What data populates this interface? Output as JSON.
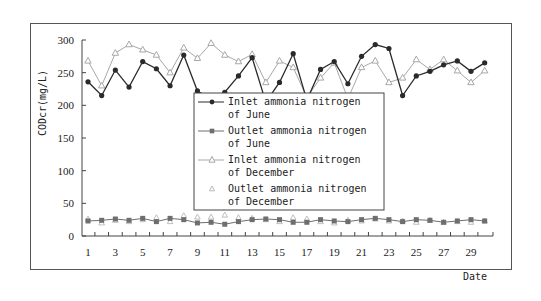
{
  "chart_data": {
    "type": "line",
    "title": "",
    "xlabel": "Date",
    "ylabel": "CODcr(mg/L)",
    "ylim": [
      0,
      300
    ],
    "xlim": [
      1,
      30
    ],
    "yticks": [
      0,
      50,
      100,
      150,
      200,
      250,
      300
    ],
    "xtick_labels": [
      "1",
      "3",
      "5",
      "7",
      "9",
      "11",
      "13",
      "15",
      "17",
      "19",
      "21",
      "23",
      "25",
      "27",
      "29"
    ],
    "xtick_values": [
      1,
      3,
      5,
      7,
      9,
      11,
      13,
      15,
      17,
      19,
      21,
      23,
      25,
      27,
      29
    ],
    "grid": false,
    "legend_position": "center",
    "x": [
      1,
      2,
      3,
      4,
      5,
      6,
      7,
      8,
      9,
      10,
      11,
      12,
      13,
      14,
      15,
      16,
      17,
      18,
      19,
      20,
      21,
      22,
      23,
      24,
      25,
      26,
      27,
      28,
      29,
      30
    ],
    "series": [
      {
        "name": "Inlet ammonia nitrogen of June",
        "legend_lines": [
          "Inlet ammonia nitrogen",
          "of June"
        ],
        "marker": "diamond",
        "line": true,
        "color": "#2a2a2a",
        "values": [
          236,
          215,
          254,
          228,
          267,
          256,
          230,
          277,
          222,
          210,
          220,
          245,
          273,
          205,
          235,
          279,
          208,
          255,
          267,
          233,
          275,
          293,
          287,
          215,
          245,
          252,
          262,
          268,
          252,
          265
        ]
      },
      {
        "name": "Outlet ammonia nitrogen of June",
        "legend_lines": [
          "Outlet ammonia nitrogen",
          "of June"
        ],
        "marker": "square",
        "line": true,
        "color": "#6e6e6e",
        "values": [
          23,
          24,
          26,
          24,
          27,
          22,
          27,
          25,
          20,
          21,
          18,
          22,
          25,
          26,
          25,
          21,
          21,
          25,
          23,
          22,
          25,
          27,
          25,
          22,
          25,
          24,
          21,
          23,
          25,
          23
        ]
      },
      {
        "name": "Inlet ammonia nitrogen of December",
        "legend_lines": [
          "Inlet ammonia nitrogen",
          "of December"
        ],
        "marker": "triangle",
        "line": true,
        "color": "#a8a8a8",
        "values": [
          268,
          230,
          280,
          293,
          285,
          277,
          250,
          288,
          272,
          295,
          277,
          267,
          278,
          235,
          268,
          258,
          212,
          242,
          265,
          210,
          258,
          268,
          235,
          242,
          270,
          255,
          270,
          253,
          235,
          253
        ]
      },
      {
        "name": "Outlet ammonia nitrogen of December",
        "legend_lines": [
          "Outlet ammonia nitrogen",
          "of December"
        ],
        "marker": "triangle-open",
        "line": false,
        "color": "#b8b8b8",
        "values": [
          26,
          20,
          24,
          22,
          25,
          28,
          22,
          31,
          29,
          29,
          32,
          28,
          27,
          25,
          22,
          28,
          26,
          22,
          20,
          24,
          23,
          26,
          23,
          23,
          21,
          24,
          21,
          22,
          21,
          23
        ]
      }
    ]
  }
}
